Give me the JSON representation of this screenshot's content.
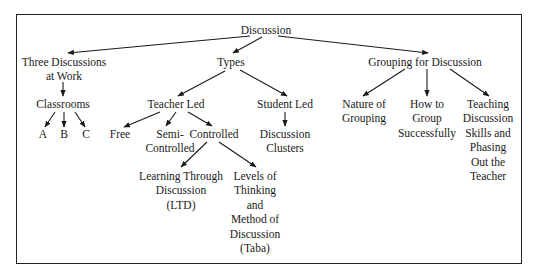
{
  "diagram": {
    "type": "tree",
    "root": "discussion",
    "nodes": {
      "discussion": {
        "lines": [
          "Discussion"
        ],
        "x": 266,
        "y": 23
      },
      "three_discussions": {
        "lines": [
          "Three Discussions",
          "at Work"
        ],
        "x": 64,
        "y": 55
      },
      "types": {
        "lines": [
          "Types"
        ],
        "x": 231,
        "y": 55
      },
      "grouping": {
        "lines": [
          "Grouping for Discussion"
        ],
        "x": 425,
        "y": 55
      },
      "classrooms": {
        "lines": [
          "Classrooms"
        ],
        "x": 63,
        "y": 97
      },
      "teacher_led": {
        "lines": [
          "Teacher Led"
        ],
        "x": 176,
        "y": 97
      },
      "student_led": {
        "lines": [
          "Student Led"
        ],
        "x": 285,
        "y": 97
      },
      "nature_of_grouping": {
        "lines": [
          "Nature of",
          "Grouping"
        ],
        "x": 364,
        "y": 97
      },
      "how_to_group": {
        "lines": [
          "How to",
          "Group",
          "Successfully"
        ],
        "x": 427,
        "y": 97
      },
      "teaching_discussion_skills": {
        "lines": [
          "Teaching",
          "Discussion",
          "Skills and",
          "Phasing",
          "Out the",
          "Teacher"
        ],
        "x": 488,
        "y": 97
      },
      "a": {
        "lines": [
          "A"
        ],
        "x": 43,
        "y": 127
      },
      "b": {
        "lines": [
          "B"
        ],
        "x": 64,
        "y": 127
      },
      "c": {
        "lines": [
          "C"
        ],
        "x": 86,
        "y": 127
      },
      "free": {
        "lines": [
          "Free"
        ],
        "x": 120,
        "y": 127
      },
      "semi_controlled": {
        "lines": [
          "Semi-",
          "Controlled"
        ],
        "x": 170,
        "y": 127
      },
      "controlled": {
        "lines": [
          "Controlled"
        ],
        "x": 214,
        "y": 127
      },
      "discussion_clusters": {
        "lines": [
          "Discussion",
          "Clusters"
        ],
        "x": 285,
        "y": 127
      },
      "ltd": {
        "lines": [
          "Learning Through",
          "Discussion",
          "(LTD)"
        ],
        "x": 181,
        "y": 169
      },
      "taba": {
        "lines": [
          "Levels of",
          "Thinking",
          "and",
          "Method of",
          "Discussion",
          "(Taba)"
        ],
        "x": 255,
        "y": 169
      }
    },
    "edges": [
      {
        "from": "discussion",
        "to": "three_discussions",
        "x1": 250,
        "y1": 36,
        "x2": 68,
        "y2": 53
      },
      {
        "from": "discussion",
        "to": "types",
        "x1": 262,
        "y1": 37,
        "x2": 233,
        "y2": 53
      },
      {
        "from": "discussion",
        "to": "grouping",
        "x1": 278,
        "y1": 36,
        "x2": 428,
        "y2": 53
      },
      {
        "from": "three_discussions",
        "to": "classrooms",
        "x1": 63,
        "y1": 82,
        "x2": 63,
        "y2": 96
      },
      {
        "from": "types",
        "to": "teacher_led",
        "x1": 225,
        "y1": 71,
        "x2": 178,
        "y2": 96
      },
      {
        "from": "types",
        "to": "student_led",
        "x1": 240,
        "y1": 70,
        "x2": 287,
        "y2": 96
      },
      {
        "from": "grouping",
        "to": "nature_of_grouping",
        "x1": 405,
        "y1": 69,
        "x2": 363,
        "y2": 96
      },
      {
        "from": "grouping",
        "to": "how_to_group",
        "x1": 427,
        "y1": 69,
        "x2": 427,
        "y2": 96
      },
      {
        "from": "grouping",
        "to": "teaching_discussion_skills",
        "x1": 450,
        "y1": 69,
        "x2": 489,
        "y2": 96
      },
      {
        "from": "classrooms",
        "to": "a",
        "x1": 55,
        "y1": 112,
        "x2": 45,
        "y2": 127
      },
      {
        "from": "classrooms",
        "to": "b",
        "x1": 64,
        "y1": 112,
        "x2": 64,
        "y2": 127
      },
      {
        "from": "classrooms",
        "to": "c",
        "x1": 75,
        "y1": 112,
        "x2": 85,
        "y2": 127
      },
      {
        "from": "teacher_led",
        "to": "free",
        "x1": 160,
        "y1": 112,
        "x2": 124,
        "y2": 127
      },
      {
        "from": "teacher_led",
        "to": "semi_controlled",
        "x1": 176,
        "y1": 112,
        "x2": 166,
        "y2": 126
      },
      {
        "from": "teacher_led",
        "to": "controlled",
        "x1": 188,
        "y1": 112,
        "x2": 212,
        "y2": 126
      },
      {
        "from": "student_led",
        "to": "discussion_clusters",
        "x1": 285,
        "y1": 112,
        "x2": 285,
        "y2": 126
      },
      {
        "from": "controlled",
        "to": "ltd",
        "x1": 207,
        "y1": 142,
        "x2": 181,
        "y2": 167
      },
      {
        "from": "controlled",
        "to": "taba",
        "x1": 219,
        "y1": 142,
        "x2": 256,
        "y2": 167
      }
    ]
  }
}
